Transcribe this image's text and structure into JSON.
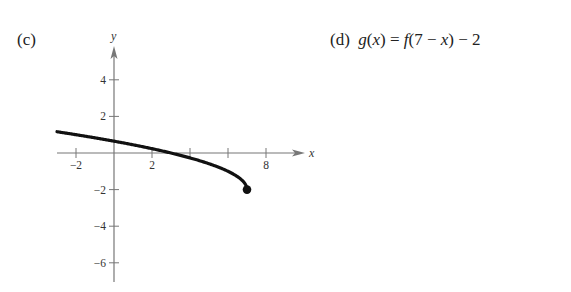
{
  "panels": {
    "c": {
      "label": "(c)"
    },
    "d": {
      "label": "(d)",
      "equation": "g(x) = f(7 − x) − 2",
      "eq_parts": {
        "lhs_fn": "g",
        "lhs_var": "x",
        "rhs_fn": "f",
        "inner": "7 − ",
        "inner_var": "x",
        "shift": " − 2"
      }
    }
  },
  "chart_data": {
    "type": "line",
    "title": "",
    "xlabel": "x",
    "ylabel": "y",
    "x_ticks": [
      -2,
      2,
      4,
      6,
      8
    ],
    "x_tick_labels": [
      "−2",
      "2",
      "8"
    ],
    "x_tick_label_values": [
      -2,
      2,
      8
    ],
    "y_ticks": [
      4,
      2,
      -2,
      -4,
      -6
    ],
    "y_tick_labels": [
      "4",
      "2",
      "−2",
      "−4",
      "−6"
    ],
    "xlim": [
      -3,
      10
    ],
    "ylim": [
      -7,
      6
    ],
    "grid": false,
    "series": [
      {
        "name": "g(x) = f(7 − x) − 2",
        "function": "sqrt(7 - x) - 2",
        "x": [
          -3,
          -2,
          -1,
          0,
          1,
          2,
          3,
          4,
          5,
          6,
          6.5,
          7
        ],
        "values": [
          1.16,
          1.0,
          0.83,
          0.65,
          0.45,
          0.24,
          0.0,
          -0.27,
          -0.59,
          -1.0,
          -1.29,
          -2.0
        ],
        "endpoint": {
          "x": 7,
          "y": -2,
          "closed": true
        }
      }
    ]
  }
}
